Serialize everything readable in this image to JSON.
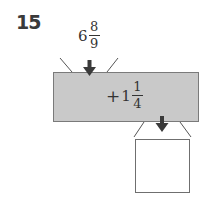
{
  "problem": {
    "number": "15",
    "input": {
      "whole": "6",
      "numerator": "8",
      "denominator": "9"
    },
    "operation": {
      "sign": "+",
      "whole": "1",
      "numerator": "1",
      "denominator": "4"
    },
    "answer": ""
  },
  "colors": {
    "machine_fill": "#c9c9c9",
    "machine_border": "#7a7a7a",
    "arrow": "#3a3a3a",
    "funnel_line": "#555555"
  }
}
